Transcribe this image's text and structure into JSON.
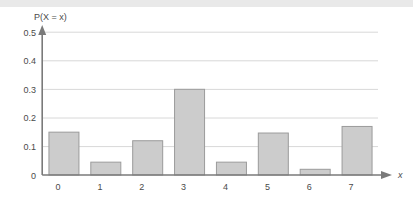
{
  "chart_data": {
    "type": "bar",
    "title": "",
    "subtitle": "",
    "ylabel": "P(X = x)",
    "xlabel": "x",
    "categories": [
      "0",
      "1",
      "2",
      "3",
      "4",
      "5",
      "6",
      "7"
    ],
    "values": [
      0.15,
      0.045,
      0.12,
      0.3,
      0.045,
      0.147,
      0.02,
      0.17
    ],
    "ylim": [
      0,
      0.5
    ],
    "y_ticks": [
      "0",
      "0.1",
      "0.2",
      "0.3",
      "0.4",
      "0.5"
    ],
    "y_tick_values": [
      0,
      0.1,
      0.2,
      0.3,
      0.4,
      0.5
    ],
    "x_ticks": [
      "0",
      "1",
      "2",
      "3",
      "4",
      "5",
      "6",
      "7"
    ],
    "grid": "horizontal",
    "legend": "none",
    "series": [
      {
        "name": "P(X = x)",
        "values": [
          0.15,
          0.045,
          0.12,
          0.3,
          0.045,
          0.147,
          0.02,
          0.17
        ]
      }
    ],
    "annotations": []
  },
  "style": {
    "bar_fill": "#cccccc",
    "bar_stroke": "#9b9b9b",
    "grid_color": "#d8d8d8",
    "axis_color": "#7a7a7a",
    "text_color": "#4a4a4a",
    "background": "#ffffff",
    "band_color": "#e9e9e9"
  }
}
